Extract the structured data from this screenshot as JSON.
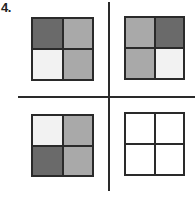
{
  "question": {
    "number": "4."
  },
  "colors": {
    "dark": "#6a6a6a",
    "medium": "#a9a9a9",
    "light": "#f2f2f2",
    "empty": "#ffffff",
    "line": "#2a2a2a"
  },
  "grids": [
    {
      "position": "top-left",
      "cells": [
        "dark",
        "medium",
        "light",
        "medium"
      ]
    },
    {
      "position": "top-right",
      "cells": [
        "medium",
        "dark",
        "medium",
        "light"
      ]
    },
    {
      "position": "bottom-left",
      "cells": [
        "light",
        "medium",
        "dark",
        "medium"
      ]
    },
    {
      "position": "bottom-right",
      "cells": [
        "empty",
        "empty",
        "empty",
        "empty"
      ]
    }
  ]
}
